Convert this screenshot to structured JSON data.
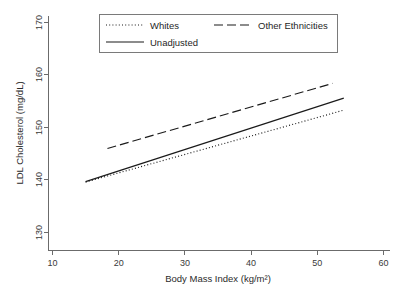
{
  "chart_data": {
    "type": "line",
    "title": "",
    "xlabel": "Body Mass Index (kg/m²)",
    "ylabel": "LDL Cholesterol (mg/dL)",
    "xlim": [
      10,
      60
    ],
    "ylim": [
      130,
      170
    ],
    "xticks": [
      10,
      20,
      30,
      40,
      50,
      60
    ],
    "yticks": [
      130,
      140,
      150,
      160,
      170
    ],
    "xtick_labels": [
      "10",
      "20",
      "30",
      "40",
      "50",
      "60"
    ],
    "ytick_labels": [
      "130",
      "140",
      "150",
      "160",
      "170"
    ],
    "grid": false,
    "legend_position": "top-center",
    "series": [
      {
        "name": "Whites",
        "style": "dotted",
        "dash_pattern": "1,2.2",
        "color": "#1a1a1a",
        "x": [
          15.0,
          54.0
        ],
        "y": [
          139.6,
          153.3
        ]
      },
      {
        "name": "Unadjusted",
        "style": "solid",
        "dash_pattern": "none",
        "color": "#1a1a1a",
        "x": [
          15.0,
          54.0
        ],
        "y": [
          139.7,
          155.6
        ]
      },
      {
        "name": "Other Ethnicities",
        "style": "long-dash",
        "dash_pattern": "9,4",
        "color": "#1a1a1a",
        "x": [
          18.3,
          52.3
        ],
        "y": [
          146.0,
          158.4
        ]
      }
    ]
  },
  "legend": {
    "entries": [
      {
        "label": "Whites"
      },
      {
        "label": "Other Ethnicities"
      },
      {
        "label": "Unadjusted"
      }
    ]
  },
  "axes": {
    "x_title": "Body Mass Index (kg/m²)",
    "y_title": "LDL Cholesterol (mg/dL)"
  }
}
